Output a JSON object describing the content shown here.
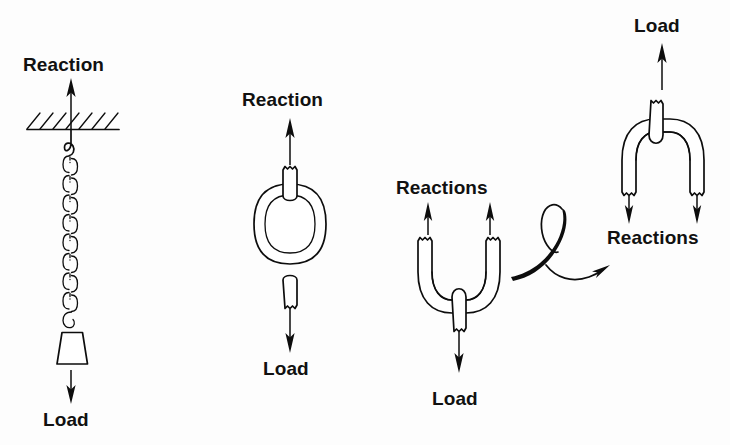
{
  "figure": {
    "background_color": "#fdfdfd",
    "ink_color": "#0d0d0d"
  },
  "panels": [
    {
      "id": "hanging-chain",
      "name": "Chain hanging from ceiling with weight",
      "labels": {
        "top": "Reaction",
        "bottom": "Load"
      },
      "elements": [
        "ceiling-hatch",
        "hook",
        "chain-links",
        "weight-block",
        "reaction-arrow-up",
        "load-arrow-down"
      ],
      "chain_link_count": 9
    },
    {
      "id": "single-link",
      "name": "Single chain link in tension",
      "labels": {
        "top": "Reaction",
        "bottom": "Load"
      },
      "elements": [
        "oval-link",
        "top-stub",
        "bottom-stub",
        "reaction-arrow-up",
        "load-arrow-down"
      ]
    },
    {
      "id": "open-link-u",
      "name": "Open U-shaped link, load at bottom",
      "labels": {
        "top": "Reactions",
        "bottom": "Load"
      },
      "elements": [
        "u-body",
        "left-leg",
        "right-leg",
        "center-stub",
        "reaction-arrow-left-up",
        "reaction-arrow-right-up",
        "load-arrow-down"
      ],
      "reaction_arrow_count": 2
    },
    {
      "id": "open-link-inverted",
      "name": "Inverted open link, load at top",
      "labels": {
        "top": "Load",
        "bottom": "Reactions"
      },
      "elements": [
        "arch-body",
        "left-leg",
        "right-leg",
        "center-stub",
        "load-arrow-up",
        "reaction-arrow-left-down",
        "reaction-arrow-right-down"
      ],
      "reaction_arrow_count": 2
    }
  ],
  "connector": {
    "name": "curved-loop-arrow",
    "description": "Hand-drawn looping arrow pointing right from the U-link panel to the inverted panel",
    "direction": "right"
  }
}
